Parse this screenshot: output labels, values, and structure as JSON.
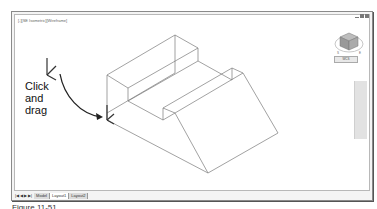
{
  "viewport": {
    "label": "[-][SE Isometric][Wireframe]",
    "wcs_label": "WCS",
    "viewcube": "viewcube-icon"
  },
  "window_controls": [
    "minimize",
    "restore",
    "close"
  ],
  "callout": {
    "line1": "Click",
    "line2": "and",
    "line3": "drag"
  },
  "tabs": {
    "nav_arrows": [
      "|◀",
      "◀",
      "▶",
      "▶|"
    ],
    "items": [
      {
        "label": "Model",
        "active": false
      },
      {
        "label": "Layout1",
        "active": true
      },
      {
        "label": "Layout2",
        "active": false
      }
    ]
  },
  "caption": "Figure 11-51",
  "colors": {
    "frame": "#8a8a8a",
    "wireframe": "#7a7a7a",
    "ucs": "#333333",
    "arrow": "#222222"
  }
}
